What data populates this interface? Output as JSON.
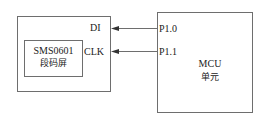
{
  "diagram": {
    "display_module": {
      "inner_title": "SMS0601",
      "inner_subtitle": "段码屏",
      "pins": [
        "DI",
        "CLK"
      ]
    },
    "mcu": {
      "title": "MCU",
      "subtitle": "单元",
      "pins": [
        "P1.0",
        "P1.1"
      ]
    },
    "connections": [
      {
        "from": "P1.0",
        "to": "DI"
      },
      {
        "from": "P1.1",
        "to": "CLK"
      }
    ],
    "colors": {
      "line": "#6e6e6e",
      "text": "#222222"
    }
  }
}
